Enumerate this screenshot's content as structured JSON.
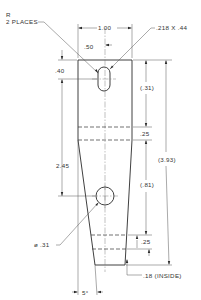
{
  "drawing": {
    "title": "Tapered link part drawing",
    "labels": {
      "radius_note_line1": "R",
      "radius_note_line2": "2 PLACES",
      "overall_width": "1.00",
      "half_width": ".50",
      "slot_size": ".218 X .44",
      "top_to_slot": ".40",
      "slot_to_groove": "(.31)",
      "groove_width_top": ".25",
      "overall_height": "(3.93)",
      "slot_to_hole": "2.45",
      "groove_to_bottom": "(.81)",
      "hole_diameter": "ø .31",
      "groove_width_bottom": ".25",
      "bottom_inside": ".18 (INSIDE)",
      "taper_angle": "5°"
    },
    "colors": {
      "line": "#2a2a2a",
      "text": "#333333",
      "background": "#ffffff"
    }
  }
}
